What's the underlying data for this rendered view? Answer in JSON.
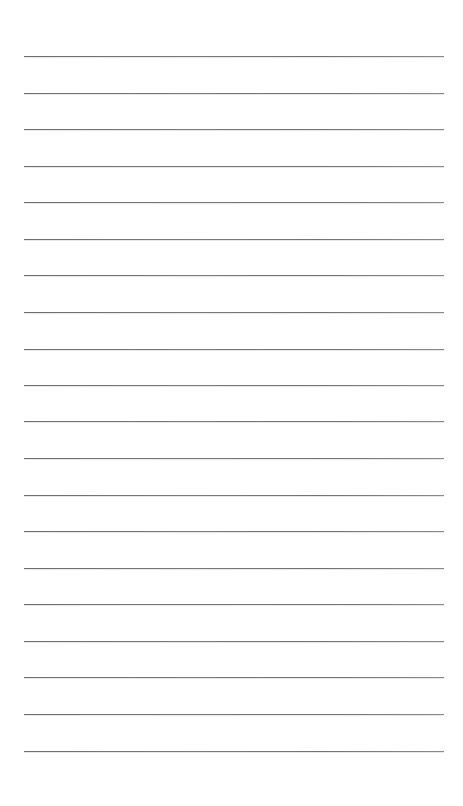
{
  "page": {
    "type": "blank-lined-paper",
    "background_color": "#ffffff",
    "line_color": "#777777",
    "line_count": 20,
    "line_left": 24,
    "line_width": 420,
    "line_positions_y": [
      56,
      93,
      129,
      166,
      202,
      239,
      275,
      312,
      349,
      385,
      421,
      458,
      495,
      531,
      568,
      604,
      641,
      677,
      714,
      751
    ]
  }
}
